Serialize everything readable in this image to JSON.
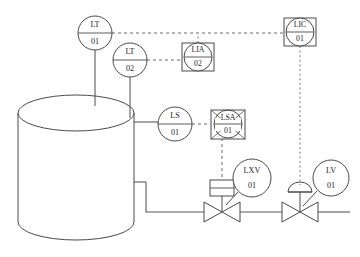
{
  "diagram": {
    "background_color": "#ffffff",
    "line_color": "#4a4a4a",
    "signal_line_color": "#6b6b6b",
    "text_color": "#1d1d1d"
  },
  "vessel": {
    "name": "tank",
    "shape": "vertical-cylinder"
  },
  "instruments": [
    {
      "id": "lt-01",
      "function": "LT",
      "number": "01",
      "symbol": "circle",
      "cx": 95,
      "cy": 33,
      "r": 17
    },
    {
      "id": "lt-02",
      "function": "LT",
      "number": "02",
      "symbol": "circle",
      "cx": 130,
      "cy": 60,
      "r": 17
    },
    {
      "id": "lia-02",
      "function": "LIA",
      "number": "02",
      "symbol": "circle-in-square",
      "cx": 198,
      "cy": 57,
      "r": 14
    },
    {
      "id": "lic-01",
      "function": "LIC",
      "number": "01",
      "symbol": "circle-in-square",
      "cx": 300,
      "cy": 32,
      "r": 14
    },
    {
      "id": "ls-01",
      "function": "LS",
      "number": "01",
      "symbol": "circle",
      "cx": 175,
      "cy": 124,
      "r": 17
    },
    {
      "id": "lsa-01",
      "function": "LSA",
      "number": "01",
      "symbol": "circle-in-crossed-square",
      "cx": 228,
      "cy": 124,
      "r": 14
    },
    {
      "id": "lxv-01",
      "function": "LXV",
      "number": "01",
      "symbol": "circle",
      "cx": 252,
      "cy": 178,
      "r": 19
    },
    {
      "id": "lv-01",
      "function": "LV",
      "number": "01",
      "symbol": "circle",
      "cx": 331,
      "cy": 178,
      "r": 18
    }
  ],
  "valves": [
    {
      "id": "valve-left",
      "type": "globe-valve-with-solenoid",
      "cx": 222,
      "cy": 212,
      "actuator": "solenoid"
    },
    {
      "id": "valve-right",
      "type": "globe-valve-with-diaphragm",
      "cx": 300,
      "cy": 212,
      "actuator": "diaphragm"
    }
  ],
  "labels": {
    "lt01_function": "LT",
    "lt01_number": "01",
    "lt02_function": "LT",
    "lt02_number": "02",
    "lia02_function": "LIA",
    "lia02_number": "02",
    "lic01_function": "LIC",
    "lic01_number": "01",
    "ls01_function": "LS",
    "ls01_number": "01",
    "lsa01_function": "LSA",
    "lsa01_number": "01",
    "lxv01_function": "LXV",
    "lxv01_number": "01",
    "lv01_function": "LV",
    "lv01_number": "01"
  }
}
